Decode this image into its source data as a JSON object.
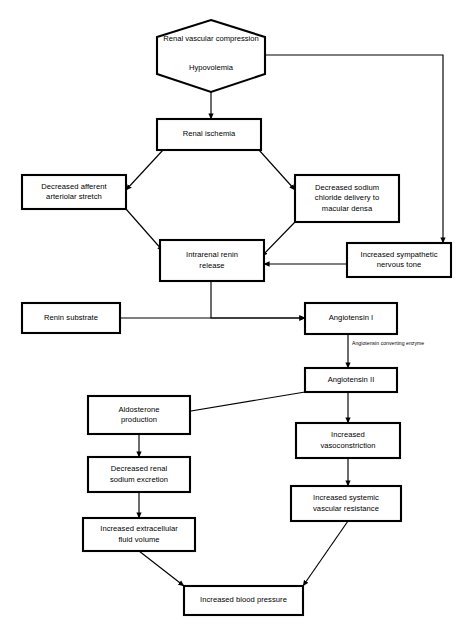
{
  "diagram": {
    "stroke_color": "#000000",
    "fill_color": "#ffffff",
    "nodes": {
      "trigger": {
        "shape": "hexagon",
        "line1": "Renal vascular",
        "line2": "compression",
        "line3": "Hypovolemia"
      },
      "renal_ischemia": {
        "label": "Renal ischemia"
      },
      "afferent_stretch": {
        "line1": "Decreased afferent",
        "line2": "arteriolar stretch"
      },
      "macula_densa": {
        "line1": "Decreased sodium",
        "line2": "chloride delivery to",
        "line3": "macular densa"
      },
      "renin_release": {
        "line1": "Intrarenal renin",
        "line2": "release"
      },
      "sympathetic_tone": {
        "line1": "Increased sympathetic",
        "line2": "nervous tone"
      },
      "renin_substrate": {
        "label": "Renin substrate"
      },
      "angiotensin_i": {
        "label": "Angiotensin I"
      },
      "angiotensin_ii": {
        "label": "Angiotensin II"
      },
      "aldosterone": {
        "line1": "Aldosterone",
        "line2": "production"
      },
      "sodium_excretion": {
        "line1": "Decreased renal",
        "line2": "sodium excretion"
      },
      "fluid_volume": {
        "line1": "Increased extracellular",
        "line2": "fluid volume"
      },
      "vasoconstriction": {
        "line1": "Increased",
        "line2": "vasoconstriction"
      },
      "vascular_resistance": {
        "line1": "Increased systemic",
        "line2": "vascular resistance"
      },
      "blood_pressure": {
        "label": "Increased blood pressure"
      }
    },
    "edge_labels": {
      "converting_enzyme": "Angiotensin converting enzyme"
    }
  }
}
